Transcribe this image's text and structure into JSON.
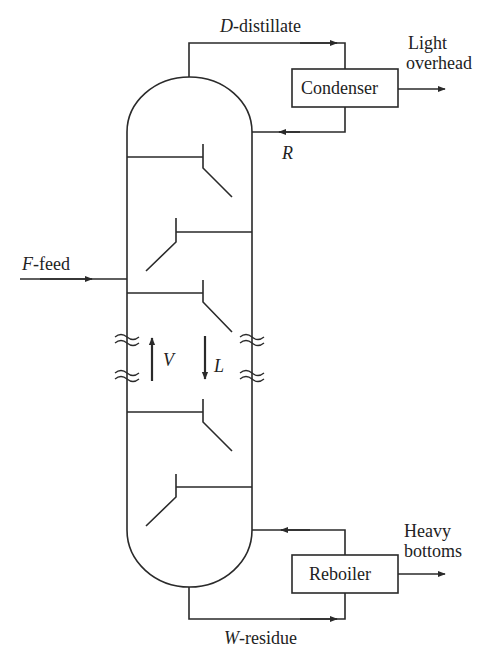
{
  "diagram": {
    "stroke_color": "#2a2a2a",
    "labels": {
      "distillate_var": "D",
      "distillate_text": "-distillate",
      "light_overhead_1": "Light",
      "light_overhead_2": "overhead",
      "condenser": "Condenser",
      "reflux": "R",
      "feed_var": "F",
      "feed_text": "-feed",
      "vapor": "V",
      "liquid": "L",
      "reboiler": "Reboiler",
      "heavy_bottoms_1": "Heavy",
      "heavy_bottoms_2": "bottoms",
      "residue_var": "W",
      "residue_text": "-residue"
    }
  }
}
